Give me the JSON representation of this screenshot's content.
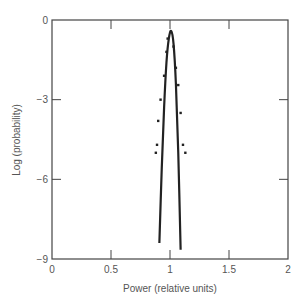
{
  "chart_data": {
    "type": "line",
    "title": "",
    "xlabel": "Power (relative units)",
    "ylabel": "Log (probability)",
    "xlim": [
      0,
      2
    ],
    "ylim": [
      -9,
      0
    ],
    "xticks": [
      0,
      0.5,
      1,
      1.5,
      2
    ],
    "xtick_labels": [
      "0",
      "0.5",
      "1",
      "1.5",
      "2"
    ],
    "yticks": [
      0,
      -3,
      -6,
      -9
    ],
    "ytick_labels": [
      "0",
      "−3",
      "−6",
      "−9"
    ],
    "grid": false,
    "legend": null,
    "series": [
      {
        "name": "fitted curve",
        "style": "line",
        "x": [
          0.91,
          0.93,
          0.95,
          0.97,
          0.99,
          1.01,
          1.03,
          1.05,
          1.07,
          1.09
        ],
        "y": [
          -8.4,
          -5.6,
          -3.3,
          -1.6,
          -0.7,
          -0.41,
          -0.9,
          -2.4,
          -5.0,
          -8.65
        ]
      },
      {
        "name": "measured points",
        "style": "scatter",
        "x": [
          0.98,
          0.97,
          0.95,
          0.92,
          0.9,
          0.89,
          0.88,
          1.03,
          1.05,
          1.07,
          1.09,
          1.11,
          1.13
        ],
        "y": [
          -0.7,
          -1.2,
          -2.1,
          -3.0,
          -3.8,
          -4.7,
          -5.0,
          -1.0,
          -1.8,
          -2.45,
          -3.5,
          -4.7,
          -5.0
        ]
      }
    ]
  },
  "labels": {
    "xlabel": "Power (relative units)",
    "ylabel": "Log (probability)"
  }
}
